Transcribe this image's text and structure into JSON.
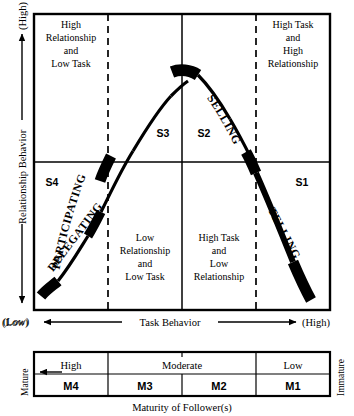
{
  "figure": {
    "quadrants": [
      {
        "id": "top-left",
        "text_lines": [
          "High",
          "Relationship",
          "and",
          "Low Task"
        ]
      },
      {
        "id": "top-right",
        "text_lines": [
          "High Task",
          "and",
          "High",
          "Relationship"
        ]
      },
      {
        "id": "bottom-left",
        "text_lines": [
          "Low",
          "Relationship",
          "and",
          "Low Task"
        ]
      },
      {
        "id": "bottom-right",
        "text_lines": [
          "High Task",
          "and",
          "Low",
          "Relationship"
        ]
      }
    ],
    "style_labels": [
      {
        "id": "S4",
        "code": "S4",
        "name": "DELEGATING"
      },
      {
        "id": "S3",
        "code": "S3",
        "name": "PARTICIPATING"
      },
      {
        "id": "S2",
        "code": "S2",
        "name": "SELLING"
      },
      {
        "id": "S1",
        "code": "S1",
        "name": "TELLING"
      }
    ],
    "y_axis": {
      "label": "Relationship Behavior",
      "high_label": "(High)",
      "low_label": "(Low)"
    },
    "x_axis": {
      "label": "Task Behavior",
      "low_label": "(Low)",
      "high_label": "(High)"
    }
  },
  "maturity": {
    "caption": "Maturity of Follower(s)",
    "left_label": "Mature",
    "right_label": "Immature",
    "headers": [
      {
        "label": "High",
        "span": 1
      },
      {
        "label": "Moderate",
        "span": 2
      },
      {
        "label": "Low",
        "span": 1
      }
    ],
    "cells": [
      "M4",
      "M3",
      "M2",
      "M1"
    ]
  },
  "colors": {
    "ink": "#000000",
    "paper": "#ffffff"
  }
}
